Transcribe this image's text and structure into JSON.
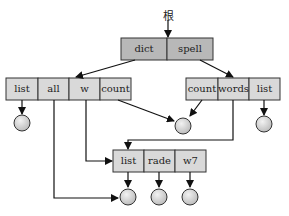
{
  "root_label": "根",
  "top_node": {
    "cells": [
      "dict",
      "spell"
    ]
  },
  "left_node": {
    "cells": [
      "list",
      "all",
      "w",
      "count"
    ]
  },
  "right_node": {
    "cells": [
      "count",
      "words",
      "list"
    ]
  },
  "bottom_node": {
    "cells": [
      "list",
      "rade",
      "w7"
    ]
  },
  "colors": {
    "cell_fill": "#d9d9d9",
    "top_fill": "#b8b8b8",
    "stroke": "#333333",
    "circle_fill": "#d6d6d6"
  }
}
